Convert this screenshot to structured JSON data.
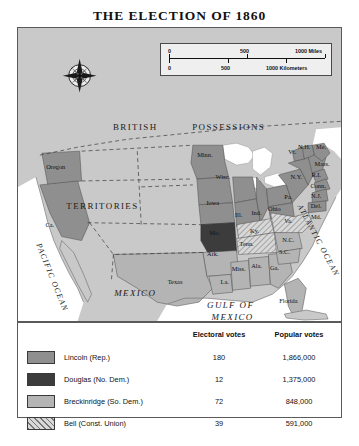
{
  "title": "THE ELECTION OF 1860",
  "colors": {
    "lincoln": "#8f8f8f",
    "douglas": "#3c3c3c",
    "breckinridge": "#b4b4b4",
    "bell": "#d8d8d8",
    "land_foreign": "#c9c9c9",
    "ocean": "#ffffff",
    "border": "#5a5a5a"
  },
  "scale_bar": {
    "miles": {
      "zero": "0",
      "mid": "500",
      "end": "1000 Miles"
    },
    "kilometers": {
      "zero": "0",
      "mid": "500",
      "end": "1000 Kilometers"
    }
  },
  "map": {
    "compass": "compass-rose",
    "region_labels": [
      {
        "text": "BRITISH",
        "x": 118,
        "y": 103
      },
      {
        "text": "POSSESSIONS",
        "x": 212,
        "y": 103
      },
      {
        "text": "TERRITORIES",
        "x": 85,
        "y": 182
      },
      {
        "text": "MEXICO",
        "x": 118,
        "y": 270
      },
      {
        "text": "GULF OF",
        "x": 214,
        "y": 282
      },
      {
        "text": "MEXICO",
        "x": 216,
        "y": 294
      }
    ],
    "ocean_labels": [
      {
        "text": "PACIFIC OCEAN",
        "x": 32,
        "y": 252
      },
      {
        "text": "ATLANTIC OCEAN",
        "x": 300,
        "y": 215
      }
    ],
    "state_labels": [
      {
        "text": "Oregon",
        "x": 38,
        "y": 142
      },
      {
        "text": "Ca.",
        "x": 32,
        "y": 200
      },
      {
        "text": "Minn.",
        "x": 188,
        "y": 130
      },
      {
        "text": "Wisc.",
        "x": 206,
        "y": 152
      },
      {
        "text": "Iowa",
        "x": 196,
        "y": 178
      },
      {
        "text": "Ill.",
        "x": 222,
        "y": 190
      },
      {
        "text": "Ind.",
        "x": 240,
        "y": 188
      },
      {
        "text": "Ohio",
        "x": 258,
        "y": 184
      },
      {
        "text": "Mo.",
        "x": 198,
        "y": 208
      },
      {
        "text": "Ark.",
        "x": 196,
        "y": 230
      },
      {
        "text": "Texas",
        "x": 158,
        "y": 258
      },
      {
        "text": "La.",
        "x": 208,
        "y": 258
      },
      {
        "text": "Miss.",
        "x": 222,
        "y": 245
      },
      {
        "text": "Ala.",
        "x": 240,
        "y": 242
      },
      {
        "text": "Ga.",
        "x": 258,
        "y": 244
      },
      {
        "text": "Florida",
        "x": 272,
        "y": 277
      },
      {
        "text": "Tenn.",
        "x": 230,
        "y": 219
      },
      {
        "text": "Ky.",
        "x": 238,
        "y": 206
      },
      {
        "text": "N.C.",
        "x": 272,
        "y": 215
      },
      {
        "text": "S.C.",
        "x": 268,
        "y": 228
      },
      {
        "text": "Va.",
        "x": 272,
        "y": 196
      },
      {
        "text": "Md.",
        "x": 300,
        "y": 192
      },
      {
        "text": "Del.",
        "x": 300,
        "y": 181
      },
      {
        "text": "N.J.",
        "x": 300,
        "y": 171
      },
      {
        "text": "Pa.",
        "x": 272,
        "y": 172
      },
      {
        "text": "N.Y.",
        "x": 280,
        "y": 152
      },
      {
        "text": "Conn.",
        "x": 302,
        "y": 161
      },
      {
        "text": "R.I.",
        "x": 300,
        "y": 150
      },
      {
        "text": "Mass.",
        "x": 306,
        "y": 139
      },
      {
        "text": "N.H.",
        "x": 288,
        "y": 122
      },
      {
        "text": "Vt.",
        "x": 276,
        "y": 127
      },
      {
        "text": "Me.",
        "x": 305,
        "y": 122
      }
    ]
  },
  "legend": {
    "headers": {
      "blank": "",
      "electoral": "Electoral votes",
      "popular": "Popular votes"
    },
    "rows": [
      {
        "swatch": "lincoln",
        "candidate": "Lincoln (Rep.)",
        "electoral": "180",
        "popular": "1,866,000"
      },
      {
        "swatch": "douglas",
        "candidate": "Douglas (No. Dem.)",
        "electoral": "12",
        "popular": "1,375,000"
      },
      {
        "swatch": "breckinridge",
        "candidate": "Breckinridge (So. Dem.)",
        "electoral": "72",
        "popular": "848,000"
      },
      {
        "swatch": "bell",
        "candidate": "Bell (Const. Union)",
        "electoral": "39",
        "popular": "591,000"
      }
    ]
  }
}
